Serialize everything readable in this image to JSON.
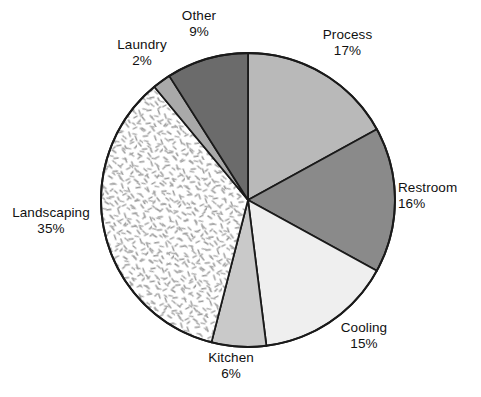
{
  "chart_data": {
    "type": "pie",
    "title": "",
    "subtitle": "",
    "xlabel": "",
    "ylabel": "",
    "legend_position": "none",
    "labels_outside": true,
    "value_unit": "%",
    "start_angle_deg": 0,
    "direction": "clockwise",
    "categories": [
      "Process",
      "Restroom",
      "Cooling",
      "Kitchen",
      "Landscaping",
      "Laundry",
      "Other"
    ],
    "values": [
      17,
      16,
      15,
      6,
      35,
      2,
      9
    ],
    "total": 100,
    "slices": [
      {
        "name": "Process",
        "value": 17,
        "value_text": "17%",
        "fill": "#b9b9b9",
        "fill_kind": "solid",
        "stroke": "#1a1a1a",
        "start_deg": 0,
        "end_deg": 61.2
      },
      {
        "name": "Restroom",
        "value": 16,
        "value_text": "16%",
        "fill": "#8a8a8a",
        "fill_kind": "solid",
        "stroke": "#1a1a1a",
        "start_deg": 61.2,
        "end_deg": 118.8
      },
      {
        "name": "Cooling",
        "value": 15,
        "value_text": "15%",
        "fill": "#efefef",
        "fill_kind": "solid",
        "stroke": "#1a1a1a",
        "start_deg": 118.8,
        "end_deg": 172.8
      },
      {
        "name": "Kitchen",
        "value": 6,
        "value_text": "6%",
        "fill": "#c9c9c9",
        "fill_kind": "solid",
        "stroke": "#1a1a1a",
        "start_deg": 172.8,
        "end_deg": 194.4
      },
      {
        "name": "Landscaping",
        "value": 35,
        "value_text": "35%",
        "fill": "#ffffff",
        "fill_kind": "stipple-dashes",
        "stroke": "#1a1a1a",
        "start_deg": 194.4,
        "end_deg": 320.4
      },
      {
        "name": "Laundry",
        "value": 2,
        "value_text": "2%",
        "fill": "#a9a9a9",
        "fill_kind": "solid",
        "stroke": "#1a1a1a",
        "start_deg": 320.4,
        "end_deg": 327.6
      },
      {
        "name": "Other",
        "value": 9,
        "value_text": "9%",
        "fill": "#6b6b6b",
        "fill_kind": "solid",
        "stroke": "#1a1a1a",
        "start_deg": 327.6,
        "end_deg": 360
      }
    ],
    "geometry": {
      "center_x": 248,
      "center_y": 200,
      "radius": 147,
      "outline_color": "#1a1a1a",
      "outline_width": 1.8,
      "background": "#ffffff"
    }
  },
  "labels": {
    "process": {
      "name": "Process",
      "value": "17%"
    },
    "restroom": {
      "name": "Restroom",
      "value": "16%"
    },
    "cooling": {
      "name": "Cooling",
      "value": "15%"
    },
    "kitchen": {
      "name": "Kitchen",
      "value": "6%"
    },
    "landscaping": {
      "name": "Landscaping",
      "value": "35%"
    },
    "laundry": {
      "name": "Laundry",
      "value": "2%"
    },
    "other": {
      "name": "Other",
      "value": "9%"
    }
  }
}
